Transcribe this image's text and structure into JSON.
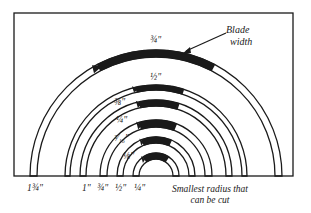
{
  "diagram": {
    "frame": {
      "x": 14,
      "y": 13,
      "width": 279,
      "height": 163
    },
    "center": {
      "x": 156,
      "y": 176
    },
    "ink_color": "#1a1a1a",
    "channels": [
      {
        "blade": "3/4\"",
        "blade_label": "¾\"",
        "outer_r": 126,
        "inner_r": 119,
        "radius_label": "1¾\"",
        "blade_arc_deg": [
          62,
          118
        ]
      },
      {
        "blade": "1/2\"",
        "blade_label": "½\"",
        "outer_r": 91,
        "inner_r": 86,
        "radius_label": "1\"",
        "blade_arc_deg": [
          72,
          103
        ]
      },
      {
        "blade": "3/8\"",
        "blade_label": "⅜\"",
        "outer_r": 76,
        "inner_r": 70,
        "radius_label": "¾\"",
        "blade_arc_deg": [
          72,
          103
        ]
      },
      {
        "blade": "1/4\"",
        "blade_label": "¼\"",
        "outer_r": 56,
        "inner_r": 49,
        "radius_label": "½\"",
        "blade_arc_deg": [
          68,
          108
        ]
      },
      {
        "blade": "3/16\"",
        "blade_label": "³⁄₁₆\"",
        "outer_r": 39,
        "inner_r": 33,
        "radius_label": "¼\"",
        "blade_arc_deg": [
          66,
          112
        ]
      },
      {
        "blade": "1/8\"",
        "blade_label": "⅛\"",
        "outer_r": 23,
        "inner_r": 17,
        "radius_label": "",
        "blade_arc_deg": [
          55,
          125
        ]
      }
    ],
    "labels": {
      "blade_width_callout": "Blade\nwidth",
      "blade_width_line1": "Blade",
      "blade_width_line2": "width",
      "blade_3_4": "¾\"",
      "blade_1_2": "½\"",
      "blade_3_8": "⅜\"",
      "blade_1_4": "¼\"",
      "blade_3_16": "³⁄₁₆\"",
      "blade_1_8": "⅛\"",
      "radius_1_3_4": "1¾\"",
      "radius_1": "1\"",
      "radius_3_4": "¾\"",
      "radius_1_2": "½\"",
      "radius_1_4": "¼\"",
      "smallest_radius_line1": "Smallest radius that",
      "smallest_radius_line2": "can be cut"
    }
  }
}
